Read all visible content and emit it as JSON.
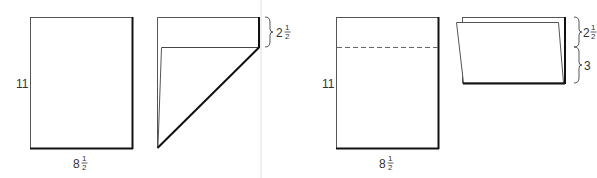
{
  "figures": [
    {
      "name": "flat-sheet",
      "height_label": "11",
      "width_label_whole": "8",
      "width_label_num": "1",
      "width_label_den": "2"
    },
    {
      "name": "corner-folded-sheet",
      "fold_label_whole": "2",
      "fold_label_num": "1",
      "fold_label_den": "2"
    },
    {
      "name": "sheet-with-fold-line",
      "height_label": "11",
      "width_label_whole": "8",
      "width_label_num": "1",
      "width_label_den": "2"
    },
    {
      "name": "folded-sheet",
      "top_label_whole": "2",
      "top_label_num": "1",
      "top_label_den": "2",
      "bottom_label": "3"
    }
  ],
  "colors": {
    "line": "#1a1a1a",
    "crease": "#d8d8d8",
    "text": "#333333"
  }
}
